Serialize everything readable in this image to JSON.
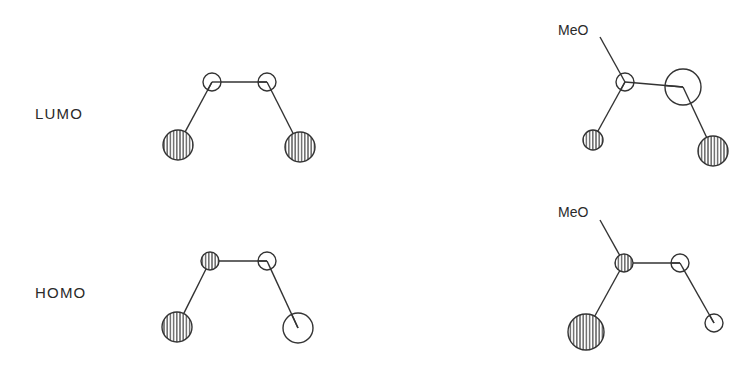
{
  "figure": {
    "rows": [
      {
        "label": "LUMO",
        "molecules": [
          {
            "name": "butadiene-lumo",
            "substituent": null,
            "atoms": [
              {
                "id": "C1",
                "cx": 178,
                "cy": 145,
                "r": 15,
                "phase": "shaded"
              },
              {
                "id": "C2",
                "cx": 212,
                "cy": 82,
                "r": 9,
                "phase": "open"
              },
              {
                "id": "C3",
                "cx": 267,
                "cy": 82,
                "r": 9,
                "phase": "open"
              },
              {
                "id": "C4",
                "cx": 300,
                "cy": 147,
                "r": 15,
                "phase": "shaded"
              }
            ]
          },
          {
            "name": "methoxybutadiene-lumo",
            "substituent": {
              "text": "MeO",
              "x": 558,
              "y": 35,
              "bond_from": [
                600,
                37
              ]
            },
            "atoms": [
              {
                "id": "C1",
                "cx": 593,
                "cy": 140,
                "r": 10,
                "phase": "shaded"
              },
              {
                "id": "C2",
                "cx": 625,
                "cy": 82,
                "r": 9,
                "phase": "open"
              },
              {
                "id": "C3",
                "cx": 683,
                "cy": 87,
                "r": 18,
                "phase": "open"
              },
              {
                "id": "C4",
                "cx": 713,
                "cy": 151,
                "r": 15,
                "phase": "shaded"
              }
            ]
          }
        ]
      },
      {
        "label": "HOMO",
        "molecules": [
          {
            "name": "butadiene-homo",
            "substituent": null,
            "atoms": [
              {
                "id": "C1",
                "cx": 177,
                "cy": 327,
                "r": 15,
                "phase": "shaded"
              },
              {
                "id": "C2",
                "cx": 210,
                "cy": 261,
                "r": 9,
                "phase": "shaded"
              },
              {
                "id": "C3",
                "cx": 267,
                "cy": 261,
                "r": 9,
                "phase": "open"
              },
              {
                "id": "C4",
                "cx": 298,
                "cy": 328,
                "r": 15,
                "phase": "open"
              }
            ]
          },
          {
            "name": "methoxybutadiene-homo",
            "substituent": {
              "text": "MeO",
              "x": 558,
              "y": 217,
              "bond_from": [
                600,
                220
              ]
            },
            "atoms": [
              {
                "id": "C1",
                "cx": 586,
                "cy": 332,
                "r": 18,
                "phase": "shaded"
              },
              {
                "id": "C2",
                "cx": 624,
                "cy": 263,
                "r": 9,
                "phase": "shaded"
              },
              {
                "id": "C3",
                "cx": 680,
                "cy": 263,
                "r": 9,
                "phase": "open"
              },
              {
                "id": "C4",
                "cx": 714,
                "cy": 323,
                "r": 9,
                "phase": "open"
              }
            ]
          }
        ]
      }
    ],
    "label_positions": {
      "LUMO": {
        "x": 35,
        "y": 119
      },
      "HOMO": {
        "x": 35,
        "y": 298
      }
    },
    "colors": {
      "stroke": "#333333",
      "background": "#ffffff",
      "hatch": "#333333"
    }
  }
}
